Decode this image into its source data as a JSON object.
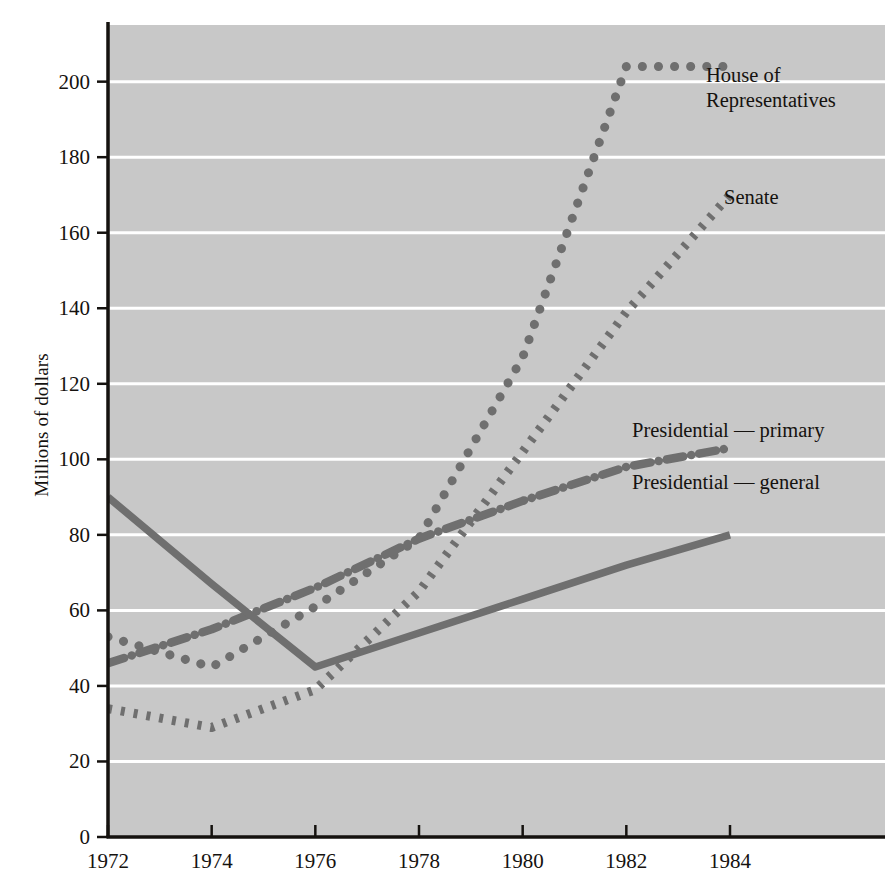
{
  "chart_data": {
    "type": "line",
    "title": "",
    "subtitle": "",
    "xlabel": "",
    "ylabel": "Millions of dollars",
    "xlim": [
      1972,
      1985.6
    ],
    "ylim": [
      0,
      215
    ],
    "xticks": [
      1972,
      1974,
      1976,
      1978,
      1980,
      1982,
      1984
    ],
    "xtick_labels": [
      "1972",
      "1974",
      "1976",
      "1978",
      "1980",
      "1982",
      "1984"
    ],
    "yticks": [
      0,
      20,
      40,
      60,
      80,
      100,
      120,
      140,
      160,
      180,
      200
    ],
    "ytick_labels": [
      "0",
      "20",
      "40",
      "60",
      "80",
      "100",
      "120",
      "140",
      "160",
      "180",
      "200"
    ],
    "grid": "horizontal-white",
    "plot_background": "#c8c8c8",
    "grid_color": "#ffffff",
    "series_color": "#6f6f6f",
    "axis_color": "#15120f",
    "legend": "inline-right-annotations",
    "x": [
      1972,
      1974,
      1976,
      1978,
      1980,
      1982,
      1984
    ],
    "series": [
      {
        "name": "House of Representatives",
        "style": "dotted",
        "label_line1": "House of",
        "label_line2": "Representatives",
        "values": [
          53,
          45,
          61,
          79,
          127,
          204,
          204
        ]
      },
      {
        "name": "Senate",
        "style": "dashed",
        "label_line1": "Senate",
        "label_line2": "",
        "values": [
          34,
          29,
          39,
          65,
          102,
          139,
          170
        ]
      },
      {
        "name": "Presidential — primary",
        "style": "dash-dot",
        "label_line1": "Presidential — primary",
        "label_line2": "",
        "values": [
          46,
          55,
          66,
          79,
          89,
          98,
          103
        ]
      },
      {
        "name": "Presidential — general",
        "style": "solid",
        "label_line1": "Presidential — general",
        "label_line2": "",
        "values": [
          90,
          67,
          45,
          54,
          63,
          72,
          80
        ]
      }
    ]
  },
  "annotations": [
    {
      "name": "house-label",
      "text": "House of\nRepresentatives",
      "x": 706,
      "y": 63
    },
    {
      "name": "senate-label",
      "text": "Senate",
      "x": 724,
      "y": 185
    },
    {
      "name": "presidential-primary-label",
      "text": "Presidential — primary",
      "x": 632,
      "y": 418
    },
    {
      "name": "presidential-general-label",
      "text": "Presidential — general",
      "x": 632,
      "y": 470
    }
  ]
}
